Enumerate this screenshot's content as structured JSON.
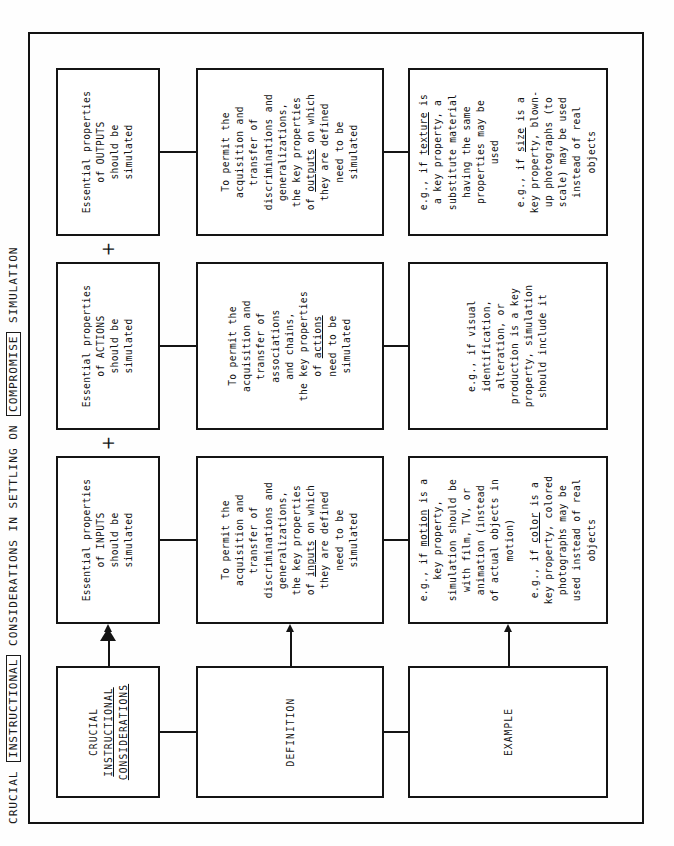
{
  "figure": {
    "title_parts": [
      {
        "text": "CRUCIAL ",
        "boxed": false
      },
      {
        "text": "INSTRUCTIONAL",
        "boxed": true
      },
      {
        "text": " CONSIDERATIONS IN SETTLING ON ",
        "boxed": false
      },
      {
        "text": "COMPROMISE",
        "boxed": true
      },
      {
        "text": " SIMULATION",
        "boxed": false
      }
    ],
    "title_plain": "CRUCIAL INSTRUCTIONAL CONSIDERATIONS IN SETTLING ON COMPROMISE SIMULATION",
    "row_labels": {
      "header": {
        "line1": "CRUCIAL",
        "line2": "INSTRUCTIONAL",
        "line3": "CONSIDERATIONS"
      },
      "definition": "DEFINITION",
      "example": "EXAMPLE"
    },
    "operators": {
      "plus": "+"
    },
    "columns": [
      {
        "key": "inputs",
        "header": {
          "line1": "Essential properties",
          "line2": "of INPUTS",
          "line3": "should be",
          "line4": "simulated"
        },
        "definition": [
          {
            "text": "To permit the"
          },
          {
            "text": "acquisition and"
          },
          {
            "text": "transfer of"
          },
          {
            "text": "discriminations and"
          },
          {
            "text": "generalizations,"
          },
          {
            "text": "the key properties"
          },
          {
            "text": "of ",
            "underline": "inputs",
            "tail": " on which"
          },
          {
            "text": "they are defined"
          },
          {
            "text": "need to be"
          },
          {
            "text": "simulated"
          }
        ],
        "examples": [
          {
            "lines": [
              {
                "text": "e.g., if ",
                "underline": "motion",
                "tail": " is a"
              },
              {
                "text": "key property,"
              },
              {
                "text": "simulation should be"
              },
              {
                "text": "with film, TV, or"
              },
              {
                "text": "animation (instead"
              },
              {
                "text": "of actual objects in"
              },
              {
                "text": "motion)"
              }
            ]
          },
          {
            "lines": [
              {
                "text": "e.g., if ",
                "underline": "color",
                "tail": " is a"
              },
              {
                "text": "key property, colored"
              },
              {
                "text": "photographs may be"
              },
              {
                "text": "used instead of real"
              },
              {
                "text": "objects"
              }
            ]
          }
        ]
      },
      {
        "key": "actions",
        "header": {
          "line1": "Essential properties",
          "line2": "of ACTIONS",
          "line3": "should be",
          "line4": "simulated"
        },
        "definition": [
          {
            "text": "To permit the"
          },
          {
            "text": "acquisition and"
          },
          {
            "text": "transfer of"
          },
          {
            "text": "associations"
          },
          {
            "text": "and chains,"
          },
          {
            "text": "the key properties"
          },
          {
            "text": "of ",
            "underline": "actions"
          },
          {
            "text": "need to be"
          },
          {
            "text": "simulated"
          }
        ],
        "examples": [
          {
            "lines": [
              {
                "text": "e.g., if visual"
              },
              {
                "text": "identification,"
              },
              {
                "text": "alteration, or"
              },
              {
                "text": "production is a key"
              },
              {
                "text": "property, simulation"
              },
              {
                "text": "should include it"
              }
            ]
          }
        ]
      },
      {
        "key": "outputs",
        "header": {
          "line1": "Essential properties",
          "line2": "of OUTPUTS",
          "line3": "should be",
          "line4": "simulated"
        },
        "definition": [
          {
            "text": "To permit the"
          },
          {
            "text": "acquisition and"
          },
          {
            "text": "transfer of"
          },
          {
            "text": "discriminations and"
          },
          {
            "text": "generalizations,"
          },
          {
            "text": "the key properties"
          },
          {
            "text": "of ",
            "underline": "outputs",
            "tail": " on which"
          },
          {
            "text": "they are defined"
          },
          {
            "text": "need to be"
          },
          {
            "text": "simulated"
          }
        ],
        "examples": [
          {
            "lines": [
              {
                "text": "e.g., if ",
                "underline": "texture",
                "tail": " is"
              },
              {
                "text": "a key property, a"
              },
              {
                "text": "substitute material"
              },
              {
                "text": "having the same"
              },
              {
                "text": "properties may be"
              },
              {
                "text": "used"
              }
            ]
          },
          {
            "lines": [
              {
                "text": "e.g., if ",
                "underline": "size",
                "tail": " is a"
              },
              {
                "text": "key property, blown-"
              },
              {
                "text": "up photographs (to"
              },
              {
                "text": "scale) may be used"
              },
              {
                "text": "instead of real"
              },
              {
                "text": "objects"
              }
            ]
          }
        ]
      }
    ]
  }
}
